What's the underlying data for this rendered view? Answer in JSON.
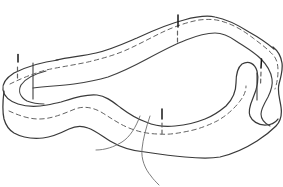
{
  "figure": {
    "pin_count": 4,
    "text_labels": []
  },
  "colors": {
    "background": "#ffffff",
    "line": "#3a3a3a",
    "inner": "#404040",
    "dash": "#636363",
    "seam": "#3f3f3f",
    "thread": "#6e6e6e",
    "pin": "#161616"
  },
  "geometry": {
    "far_top_edge": "M 56,60 C 70,57 83,56 96,53 C 110,50 123,44 137,38 C 152,31 168,24 184,20 C 195,17 206,15 215,17 C 226,19 238,25 249,32 C 258,37 267,43 274,49",
    "outer_silhouette": "M 4,91 C 3,99 2,110 4,119 C 6,126 9,130 14,133 C 23,138 33,139 43,138 C 53,137 61,133 69,129 C 75,126 81,125 88,128 C 96,131 102,136 110,141 C 120,147 132,151 145,152 C 158,154 171,156 185,157 C 196,158 208,159 220,157 C 233,154 246,148 257,141 C 265,136 271,131 276,126 C 281,121 282,114 281,107 C 280,99 277,92 279,84 C 281,77 283,70 282,63 C 281,56 278,51 273,47",
    "top_edge_loop": "M 58,60 C 42,62 26,67 14,73 C 6,78 2,84 3,90 C 4,96 9,101 18,104 C 27,107 37,107 47,105 C 52,104 56,103 61,102 C 74,98 86,94 97,95 C 106,96 113,102 121,108 C 129,114 137,119 146,122 C 155,126 165,127 175,126 C 185,125 195,123 205,119 C 213,116 220,111 226,106 C 233,99 236,91 236,83 C 236,75 237,68 242,64 C 249,60 255,64 257,71 C 259,79 257,89 253,98 C 250,105 248,111 250,116 C 252,121 258,125 265,125 C 271,125 275,123 278,119",
    "inner_bottom_edge": "M 33,88 C 48,86 60,86 74,84 C 88,82 98,80 108,77 C 122,72 134,66 147,59 C 160,52 173,45 186,40 C 196,36 206,33 215,33 C 223,33 229,36 236,41 C 245,47 254,52 261,59 C 267,65 271,72 272,79 C 273,85 271,91 268,97 C 264,104 261,109 261,114 C 261,119 264,123 270,126",
    "left_inner_crescent": "M 46,71 C 34,74 25,79 21,85 C 18,91 20,97 27,101 C 32,103 38,104 44,104",
    "left_seam": "M 33,63 L 33,99",
    "right_seam": "M 257,73 L 257,100",
    "top_basting_dashes": "M 10,84 C 20,79 32,74 46,70 C 60,67 74,65 88,62 C 100,59 112,56 124,51 C 138,45 152,37 165,31 C 176,26 188,22 199,20 C 208,19 216,19 224,22 C 234,25 244,31 253,38 C 261,44 269,50 274,56 C 277,60 278,65 278,71 C 278,77 277,83 275,89",
    "front_basting_dashes": "M 9,111 C 18,115 28,119 39,119 C 51,119 63,114 75,109 C 83,106 92,107 101,112 C 111,118 119,124 129,128 C 139,132 149,134 159,134 C 169,135 179,133 189,131 C 199,129 209,125 217,121 C 226,116 234,109 240,101 C 244,96 246,91 246,86",
    "thread_left": "M 140,116 C 136,127 130,137 122,142 C 114,147 105,150 96,150",
    "thread_right": "M 150,116 C 146,128 143,139 142,149 C 141,159 145,169 151,176 C 153,179 156,182 159,185"
  },
  "pin_head_radius": "2.3",
  "pins": [
    {
      "x": "18",
      "y": "52",
      "shaft_d": "M 18,54.5 L 18,62",
      "dash_d": "M 17.5,67 L 17.5,80"
    },
    {
      "x": "178",
      "y": "13",
      "shaft_d": "M 178,15 L 178,27",
      "dash_d": "M 177.5,31 L 177.5,42"
    },
    {
      "x": "262",
      "y": "57",
      "shaft_d": "M 261.5,59 L 261,68",
      "dash_d": "M 261,72 L 260.5,85"
    },
    {
      "x": "162",
      "y": "107",
      "shaft_d": "M 162,109 L 162,119",
      "dash_d": "M 162,123 L 162,136"
    }
  ]
}
